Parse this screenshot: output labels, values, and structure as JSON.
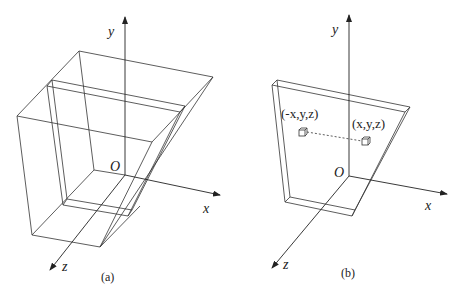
{
  "panels": [
    {
      "id": "a",
      "caption": "(a)",
      "axes": {
        "x": "x",
        "y": "y",
        "z": "z",
        "origin": "O"
      },
      "description": "Wireframe truncated pyramid (frustum) with inner thin slab"
    },
    {
      "id": "b",
      "caption": "(b)",
      "axes": {
        "x": "x",
        "y": "y",
        "z": "z",
        "origin": "O"
      },
      "points": [
        {
          "label": "(-x,y,z)"
        },
        {
          "label": "(x,y,z)"
        }
      ],
      "description": "Thin plate with symmetric points connected by dashed line"
    }
  ]
}
